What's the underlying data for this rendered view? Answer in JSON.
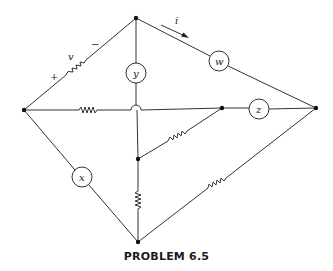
{
  "figure": {
    "caption": "PROBLEM 6.5"
  },
  "labels": {
    "v": "v",
    "plus": "+",
    "minus": "−",
    "i": "i",
    "y": "y",
    "w": "w",
    "z": "z",
    "x": "x"
  },
  "nodes": [
    {
      "id": "top",
      "x": 136,
      "y": 18
    },
    {
      "id": "left",
      "x": 24,
      "y": 110
    },
    {
      "id": "right",
      "x": 316,
      "y": 108
    },
    {
      "id": "bottom",
      "x": 138,
      "y": 242
    },
    {
      "id": "middle",
      "x": 138,
      "y": 159
    },
    {
      "id": "h-junction",
      "x": 222,
      "y": 108
    }
  ],
  "elements": [
    {
      "type": "resistor",
      "between": [
        "left",
        "top"
      ],
      "label": "v"
    },
    {
      "type": "element",
      "between": [
        "top",
        "right"
      ],
      "label": "w"
    },
    {
      "type": "element",
      "between": [
        "top",
        "middle"
      ],
      "label": "y"
    },
    {
      "type": "resistor",
      "between": [
        "left",
        "h-junction"
      ]
    },
    {
      "type": "element",
      "between": [
        "h-junction",
        "right"
      ],
      "label": "z"
    },
    {
      "type": "resistor",
      "between": [
        "middle",
        "h-junction"
      ]
    },
    {
      "type": "element",
      "between": [
        "left",
        "bottom"
      ],
      "label": "x"
    },
    {
      "type": "resistor",
      "between": [
        "middle",
        "bottom"
      ]
    },
    {
      "type": "resistor",
      "between": [
        "bottom",
        "right"
      ]
    }
  ],
  "current_arrow": {
    "label": "i",
    "direction": "top-to-right"
  }
}
